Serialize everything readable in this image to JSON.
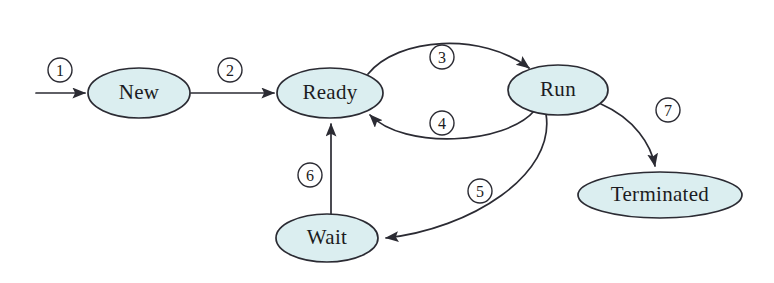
{
  "diagram": {
    "background_color": "#ffffff",
    "node_fill_color": "#dbeef0",
    "node_stroke_color": "#2b2b33",
    "edge_color": "#2b2b33",
    "nodes": [
      {
        "id": "new",
        "label": "New",
        "cx": 139,
        "cy": 93,
        "rx": 51,
        "ry": 25
      },
      {
        "id": "ready",
        "label": "Ready",
        "cx": 330,
        "cy": 93,
        "rx": 53,
        "ry": 25
      },
      {
        "id": "run",
        "label": "Run",
        "cx": 558,
        "cy": 90,
        "rx": 50,
        "ry": 25
      },
      {
        "id": "wait",
        "label": "Wait",
        "cx": 327,
        "cy": 238,
        "rx": 51,
        "ry": 24
      },
      {
        "id": "terminated",
        "label": "Terminated",
        "cx": 660,
        "cy": 195,
        "rx": 82,
        "ry": 23
      }
    ],
    "edges": [
      {
        "id": "e1",
        "label": "1",
        "from": "start",
        "to": "new",
        "label_x": 60,
        "label_y": 70
      },
      {
        "id": "e2",
        "label": "2",
        "from": "new",
        "to": "ready",
        "label_x": 230,
        "label_y": 70
      },
      {
        "id": "e3",
        "label": "3",
        "from": "ready",
        "to": "run",
        "label_x": 442,
        "label_y": 57
      },
      {
        "id": "e4",
        "label": "4",
        "from": "run",
        "to": "ready",
        "label_x": 442,
        "label_y": 123
      },
      {
        "id": "e5",
        "label": "5",
        "from": "run",
        "to": "wait",
        "label_x": 480,
        "label_y": 191
      },
      {
        "id": "e6",
        "label": "6",
        "from": "wait",
        "to": "ready",
        "label_x": 310,
        "label_y": 175
      },
      {
        "id": "e7",
        "label": "7",
        "from": "run",
        "to": "terminated",
        "label_x": 668,
        "label_y": 110
      }
    ]
  }
}
